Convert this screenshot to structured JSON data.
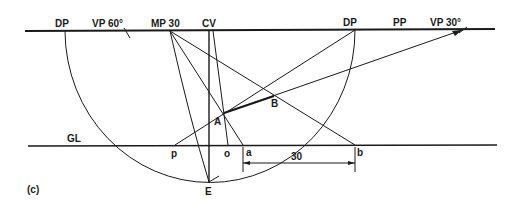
{
  "figure": {
    "caption": "(c)",
    "lines": {
      "picture_plane": "PP",
      "ground_line": "GL"
    },
    "top_labels": {
      "dp_left": "DP",
      "vp60": "VP 60°",
      "mp30": "MP 30",
      "cv": "CV",
      "dp_right": "DP",
      "pp": "PP",
      "vp30": "VP 30°"
    },
    "points": {
      "A": "A",
      "B": "B",
      "E": "E"
    },
    "ground_points": {
      "p": "p",
      "o": "o",
      "a": "a",
      "b": "b"
    },
    "dimension": "30"
  }
}
